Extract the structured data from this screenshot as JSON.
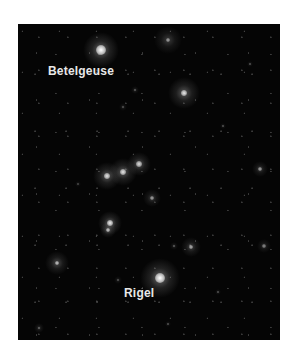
{
  "image": {
    "subject": "Orion constellation star field",
    "background_color": "#050505",
    "frame_color": "#ffffff"
  },
  "labels": [
    {
      "text": "Betelgeuse",
      "x": 30,
      "y": 40
    },
    {
      "text": "Rigel",
      "x": 106,
      "y": 262
    }
  ],
  "stars": [
    {
      "name": "betelgeuse",
      "x": 83,
      "y": 26,
      "core": 5,
      "glow": 18,
      "brightness": 1.0
    },
    {
      "name": "bellatrix",
      "x": 166,
      "y": 69,
      "core": 3,
      "glow": 16,
      "brightness": 0.85
    },
    {
      "name": "meissa",
      "x": 150,
      "y": 16,
      "core": 2,
      "glow": 14,
      "brightness": 0.55
    },
    {
      "name": "alnitak",
      "x": 89,
      "y": 152,
      "core": 3,
      "glow": 14,
      "brightness": 0.85
    },
    {
      "name": "alnilam",
      "x": 105,
      "y": 148,
      "core": 3,
      "glow": 14,
      "brightness": 0.85
    },
    {
      "name": "mintaka",
      "x": 121,
      "y": 140,
      "core": 3,
      "glow": 12,
      "brightness": 0.8
    },
    {
      "name": "sword-1",
      "x": 92,
      "y": 199,
      "core": 3,
      "glow": 12,
      "brightness": 0.9
    },
    {
      "name": "sword-2",
      "x": 90,
      "y": 206,
      "core": 2,
      "glow": 8,
      "brightness": 0.7
    },
    {
      "name": "saiph-area",
      "x": 39,
      "y": 239,
      "core": 2,
      "glow": 12,
      "brightness": 0.7
    },
    {
      "name": "rigel",
      "x": 142,
      "y": 254,
      "core": 5,
      "glow": 20,
      "brightness": 1.0
    },
    {
      "name": "star-a",
      "x": 134,
      "y": 174,
      "core": 2,
      "glow": 9,
      "brightness": 0.55
    },
    {
      "name": "star-b",
      "x": 173,
      "y": 223,
      "core": 2,
      "glow": 10,
      "brightness": 0.6
    },
    {
      "name": "star-c",
      "x": 242,
      "y": 145,
      "core": 2,
      "glow": 8,
      "brightness": 0.55
    },
    {
      "name": "star-d",
      "x": 246,
      "y": 222,
      "core": 2,
      "glow": 7,
      "brightness": 0.45
    },
    {
      "name": "star-e",
      "x": 21,
      "y": 304,
      "core": 1,
      "glow": 5,
      "brightness": 0.45
    },
    {
      "name": "star-f",
      "x": 117,
      "y": 66,
      "core": 1,
      "glow": 4,
      "brightness": 0.4
    },
    {
      "name": "star-g",
      "x": 105,
      "y": 83,
      "core": 1,
      "glow": 4,
      "brightness": 0.35
    },
    {
      "name": "star-h",
      "x": 156,
      "y": 222,
      "core": 1,
      "glow": 4,
      "brightness": 0.4
    },
    {
      "name": "star-i",
      "x": 100,
      "y": 256,
      "core": 1,
      "glow": 4,
      "brightness": 0.35
    },
    {
      "name": "star-j",
      "x": 205,
      "y": 102,
      "core": 1,
      "glow": 3,
      "brightness": 0.35
    },
    {
      "name": "star-k",
      "x": 232,
      "y": 40,
      "core": 1,
      "glow": 3,
      "brightness": 0.35
    },
    {
      "name": "star-l",
      "x": 200,
      "y": 268,
      "core": 1,
      "glow": 3,
      "brightness": 0.35
    },
    {
      "name": "star-m",
      "x": 150,
      "y": 300,
      "core": 1,
      "glow": 3,
      "brightness": 0.35
    },
    {
      "name": "star-n",
      "x": 60,
      "y": 160,
      "core": 1,
      "glow": 3,
      "brightness": 0.3
    }
  ]
}
